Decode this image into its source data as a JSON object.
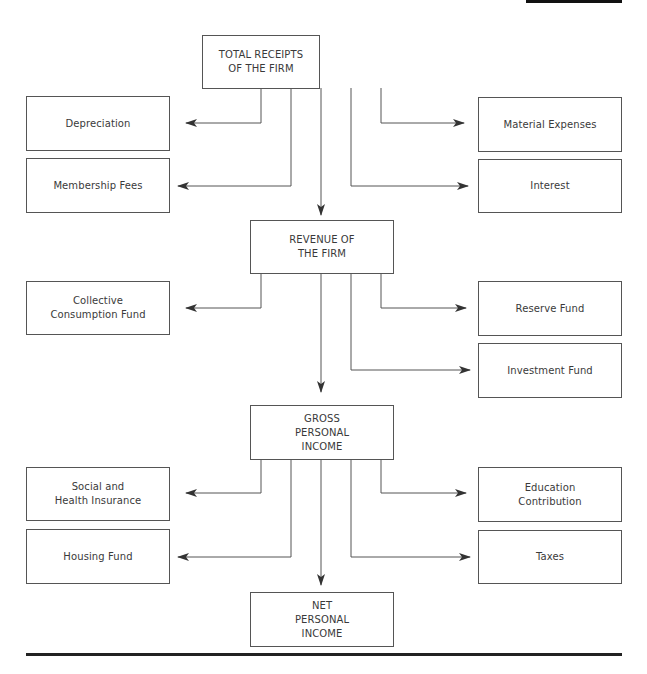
{
  "diagram": {
    "type": "flowchart",
    "main_flow": [
      {
        "id": "total",
        "label": "TOTAL RECEIPTS\nOF THE FIRM"
      },
      {
        "id": "revenue",
        "label": "REVENUE OF\nTHE FIRM"
      },
      {
        "id": "gross",
        "label": "GROSS\nPERSONAL\nINCOME"
      },
      {
        "id": "net",
        "label": "NET\nPERSONAL\nINCOME"
      }
    ],
    "deductions": {
      "total": {
        "left": [
          "Depreciation",
          "Membership Fees"
        ],
        "right": [
          "Material Expenses",
          "Interest"
        ]
      },
      "revenue": {
        "left": [
          "Collective\nConsumption Fund"
        ],
        "right": [
          "Reserve Fund",
          "Investment Fund"
        ]
      },
      "gross": {
        "left": [
          "Social and\nHealth Insurance",
          "Housing Fund"
        ],
        "right": [
          "Education\nContribution",
          "Taxes"
        ]
      }
    },
    "colors": {
      "line": "#555555",
      "text": "#3a3a3a",
      "rule": "#222222"
    }
  }
}
